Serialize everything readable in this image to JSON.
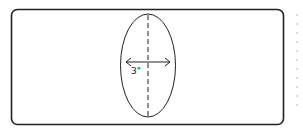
{
  "diagram": {
    "dimension_label": "3\"",
    "colors": {
      "stroke": "#222222",
      "background": "#ffffff",
      "dots": "#cfcfcf"
    }
  }
}
